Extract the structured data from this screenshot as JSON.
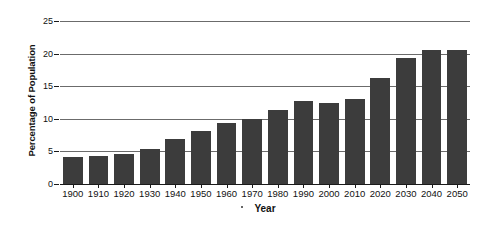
{
  "chart_data": {
    "type": "bar",
    "title": "",
    "subtitle": "",
    "xlabel": "Year",
    "ylabel": "Percentage of Population",
    "categories": [
      "1900",
      "1910",
      "1920",
      "1930",
      "1940",
      "1950",
      "1960",
      "1970",
      "1980",
      "1990",
      "2000",
      "2010",
      "2020",
      "2030",
      "2040",
      "2050"
    ],
    "values": [
      4.1,
      4.3,
      4.6,
      5.4,
      6.9,
      8.2,
      9.3,
      9.9,
      11.3,
      12.7,
      12.5,
      13.1,
      16.2,
      19.4,
      20.5,
      20.6
    ],
    "series": [
      {
        "name": "Percentage of Population",
        "values": [
          4.1,
          4.3,
          4.6,
          5.4,
          6.9,
          8.2,
          9.3,
          9.9,
          11.3,
          12.7,
          12.5,
          13.1,
          16.2,
          19.4,
          20.5,
          20.6
        ]
      }
    ],
    "ylim": [
      0,
      25
    ],
    "yticks": [
      0,
      5,
      10,
      15,
      20,
      25
    ],
    "ytick_labels": [
      "0",
      "5",
      "10",
      "15",
      "20",
      "25"
    ],
    "grid": true,
    "grid_axis": "y",
    "legend": false,
    "legend_position": "none",
    "bar_color": "#3c3c3c",
    "gridline_color": "#6b6b6b",
    "axis_color": "#1a1a1a",
    "background_color": "#ffffff",
    "annotations": []
  },
  "axes": {
    "y_title": "Percentage of Population",
    "x_title": "Year"
  }
}
